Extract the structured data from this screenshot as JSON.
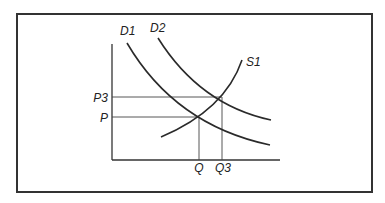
{
  "diagram": {
    "type": "supply-demand",
    "labels": {
      "d1": "D1",
      "d2": "D2",
      "s1": "S1",
      "p": "P",
      "p3": "P3",
      "q": "Q",
      "q3": "Q3"
    },
    "curves": [
      {
        "name": "D1",
        "kind": "demand"
      },
      {
        "name": "D2",
        "kind": "demand"
      },
      {
        "name": "S1",
        "kind": "supply"
      }
    ],
    "equilibria": [
      {
        "price": "P",
        "quantity": "Q",
        "curves": [
          "D1",
          "S1"
        ]
      },
      {
        "price": "P3",
        "quantity": "Q3",
        "curves": [
          "D2",
          "S1"
        ]
      }
    ],
    "colors": {
      "line": "#2a2a2a",
      "frame": "#333333",
      "background": "#ffffff"
    }
  }
}
